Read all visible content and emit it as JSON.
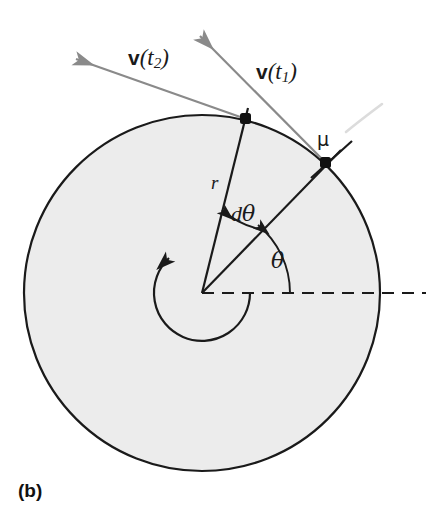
{
  "figure": {
    "panel_label": "(b)",
    "domain_type": "physics-diagram"
  },
  "colors": {
    "disk_fill": "#ececec",
    "disk_stroke": "#1a1a1a",
    "vector_gray": "#8a8a8a",
    "ghost_gray": "#d8d8d8",
    "text": "#1a1a1a",
    "background": "#ffffff"
  },
  "geometry": {
    "center_x": 202,
    "center_y": 293,
    "radius": 178,
    "inner_arc_radius": 48,
    "point_t2_x": 245,
    "point_t2_y": 118,
    "point_t1_x": 325,
    "point_t1_y": 162
  },
  "labels": {
    "v_t2": {
      "bold": "v",
      "open": "(",
      "var": "t",
      "sub": "2",
      "close": ")"
    },
    "v_t1": {
      "bold": "v",
      "open": "(",
      "var": "t",
      "sub": "1",
      "close": ")"
    },
    "mu": "μ",
    "radius": "r",
    "d_theta_d": "d",
    "d_theta_sym": "θ",
    "theta": "θ",
    "panel": "(b)"
  },
  "annotations": [
    {
      "name": "radius-label",
      "text": "r"
    },
    {
      "name": "d-theta-label",
      "text": "dθ"
    },
    {
      "name": "theta-label",
      "text": "θ"
    },
    {
      "name": "mu-label",
      "text": "μ"
    },
    {
      "name": "velocity-t1-label",
      "text": "v(t1)"
    },
    {
      "name": "velocity-t2-label",
      "text": "v(t2)"
    },
    {
      "name": "panel-label",
      "text": "(b)"
    }
  ]
}
